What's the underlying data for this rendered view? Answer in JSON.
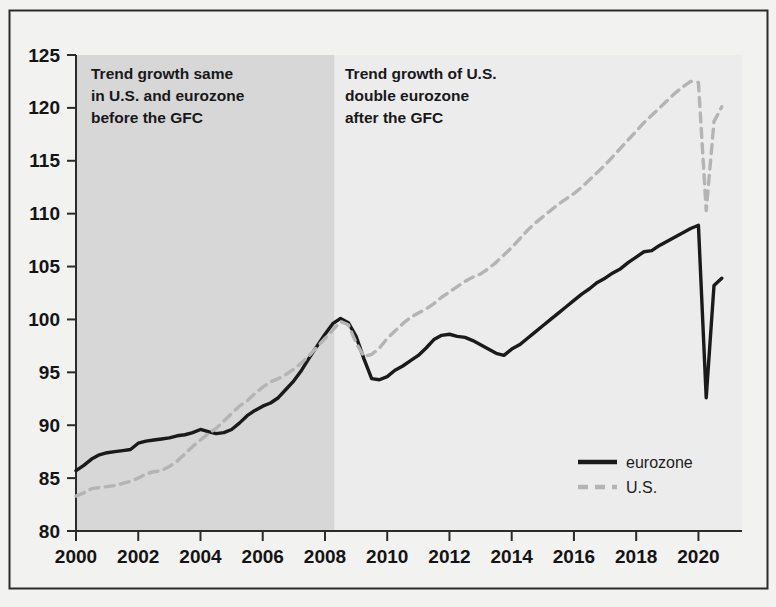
{
  "figure": {
    "background_color": "#f2f2f1",
    "border_color": "#2b2b2b",
    "plot_background_color": "#ececec",
    "shaded_band_color": "#d7d7d7"
  },
  "annotations": [
    {
      "id": "pre-gfc",
      "lines": [
        "Trend growth same",
        "in U.S. and eurozone",
        "before the GFC"
      ]
    },
    {
      "id": "post-gfc",
      "lines": [
        "Trend growth of U.S.",
        "double eurozone",
        "after the GFC"
      ]
    }
  ],
  "legend": {
    "position": "bottom-right",
    "entries": [
      {
        "label": "eurozone",
        "color": "#1a1a1a",
        "style": "solid"
      },
      {
        "label": "U.S.",
        "color": "#b4b4b4",
        "style": "dashed"
      }
    ]
  },
  "chart_data": {
    "type": "line",
    "title": "",
    "subtitle": "",
    "xlabel": "",
    "ylabel": "",
    "xlim": [
      2000,
      2021.4
    ],
    "ylim": [
      80,
      125
    ],
    "grid": false,
    "legend_position": "bottom-right",
    "xticks": [
      2000,
      2002,
      2004,
      2006,
      2008,
      2010,
      2012,
      2014,
      2016,
      2018,
      2020
    ],
    "xtick_labels": [
      "2000",
      "2002",
      "2004",
      "2006",
      "2008",
      "2010",
      "2012",
      "2014",
      "2016",
      "2018",
      "2020"
    ],
    "yticks": [
      80,
      85,
      90,
      95,
      100,
      105,
      110,
      115,
      120,
      125
    ],
    "ytick_labels": [
      "80",
      "85",
      "90",
      "95",
      "100",
      "105",
      "110",
      "115",
      "120",
      "125"
    ],
    "shaded_region": {
      "x_start": 2000,
      "x_end": 2008.3,
      "label": "pre-GFC period"
    },
    "series": [
      {
        "name": "eurozone",
        "color": "#1a1a1a",
        "style": "solid",
        "width": 3.4,
        "x": [
          2000.0,
          2000.25,
          2000.5,
          2000.75,
          2001.0,
          2001.25,
          2001.5,
          2001.75,
          2002.0,
          2002.25,
          2002.5,
          2002.75,
          2003.0,
          2003.25,
          2003.5,
          2003.75,
          2004.0,
          2004.25,
          2004.5,
          2004.75,
          2005.0,
          2005.25,
          2005.5,
          2005.75,
          2006.0,
          2006.25,
          2006.5,
          2006.75,
          2007.0,
          2007.25,
          2007.5,
          2007.75,
          2008.0,
          2008.25,
          2008.5,
          2008.75,
          2009.0,
          2009.25,
          2009.5,
          2009.75,
          2010.0,
          2010.25,
          2010.5,
          2010.75,
          2011.0,
          2011.25,
          2011.5,
          2011.75,
          2012.0,
          2012.25,
          2012.5,
          2012.75,
          2013.0,
          2013.25,
          2013.5,
          2013.75,
          2014.0,
          2014.25,
          2014.5,
          2014.75,
          2015.0,
          2015.25,
          2015.5,
          2015.75,
          2016.0,
          2016.25,
          2016.5,
          2016.75,
          2017.0,
          2017.25,
          2017.5,
          2017.75,
          2018.0,
          2018.25,
          2018.5,
          2018.75,
          2019.0,
          2019.25,
          2019.5,
          2019.75,
          2020.0,
          2020.25,
          2020.5,
          2020.75
        ],
        "y": [
          85.7,
          86.2,
          86.8,
          87.2,
          87.4,
          87.5,
          87.6,
          87.7,
          88.3,
          88.5,
          88.6,
          88.7,
          88.8,
          89.0,
          89.1,
          89.3,
          89.6,
          89.4,
          89.2,
          89.3,
          89.6,
          90.2,
          90.9,
          91.4,
          91.8,
          92.1,
          92.6,
          93.4,
          94.2,
          95.2,
          96.4,
          97.5,
          98.6,
          99.6,
          100.1,
          99.7,
          98.4,
          96.3,
          94.4,
          94.3,
          94.6,
          95.2,
          95.6,
          96.1,
          96.6,
          97.3,
          98.1,
          98.5,
          98.6,
          98.4,
          98.3,
          98.0,
          97.6,
          97.2,
          96.8,
          96.6,
          97.2,
          97.6,
          98.2,
          98.8,
          99.4,
          100.0,
          100.6,
          101.2,
          101.8,
          102.4,
          102.9,
          103.5,
          103.9,
          104.4,
          104.8,
          105.4,
          105.9,
          106.4,
          106.5,
          107.0,
          107.4,
          107.8,
          108.2,
          108.6,
          108.9,
          92.6,
          103.2,
          103.9
        ]
      },
      {
        "name": "U.S.",
        "color": "#b4b4b4",
        "style": "dashed",
        "width": 3.4,
        "x": [
          2000.0,
          2000.25,
          2000.5,
          2000.75,
          2001.0,
          2001.25,
          2001.5,
          2001.75,
          2002.0,
          2002.25,
          2002.5,
          2002.75,
          2003.0,
          2003.25,
          2003.5,
          2003.75,
          2004.0,
          2004.25,
          2004.5,
          2004.75,
          2005.0,
          2005.25,
          2005.5,
          2005.75,
          2006.0,
          2006.25,
          2006.5,
          2006.75,
          2007.0,
          2007.25,
          2007.5,
          2007.75,
          2008.0,
          2008.25,
          2008.5,
          2008.75,
          2009.0,
          2009.25,
          2009.5,
          2009.75,
          2010.0,
          2010.25,
          2010.5,
          2010.75,
          2011.0,
          2011.25,
          2011.5,
          2011.75,
          2012.0,
          2012.25,
          2012.5,
          2012.75,
          2013.0,
          2013.25,
          2013.5,
          2013.75,
          2014.0,
          2014.25,
          2014.5,
          2014.75,
          2015.0,
          2015.25,
          2015.5,
          2015.75,
          2016.0,
          2016.25,
          2016.5,
          2016.75,
          2017.0,
          2017.25,
          2017.5,
          2017.75,
          2018.0,
          2018.25,
          2018.5,
          2018.75,
          2019.0,
          2019.25,
          2019.5,
          2019.75,
          2020.0,
          2020.25,
          2020.5,
          2020.75
        ],
        "y": [
          83.3,
          83.6,
          84.0,
          84.1,
          84.2,
          84.3,
          84.5,
          84.7,
          85.0,
          85.4,
          85.6,
          85.7,
          86.1,
          86.6,
          87.3,
          88.0,
          88.6,
          89.2,
          89.7,
          90.4,
          91.1,
          91.8,
          92.3,
          93.0,
          93.6,
          94.1,
          94.4,
          94.8,
          95.3,
          95.9,
          96.6,
          97.4,
          98.2,
          99.0,
          99.8,
          99.5,
          97.8,
          96.5,
          96.7,
          97.3,
          98.2,
          98.9,
          99.6,
          100.2,
          100.6,
          101.0,
          101.5,
          102.1,
          102.6,
          103.1,
          103.6,
          104.0,
          104.3,
          104.8,
          105.4,
          106.1,
          106.8,
          107.6,
          108.4,
          109.1,
          109.7,
          110.3,
          110.9,
          111.4,
          111.9,
          112.5,
          113.2,
          113.9,
          114.6,
          115.4,
          116.2,
          117.0,
          117.8,
          118.6,
          119.3,
          120.0,
          120.7,
          121.4,
          122.0,
          122.5,
          122.4,
          110.3,
          118.7,
          120.1
        ]
      }
    ]
  }
}
